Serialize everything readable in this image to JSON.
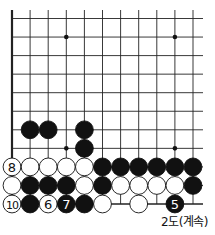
{
  "diagram": {
    "caption": "2도(계속)",
    "grid": {
      "cols": 11,
      "rows": 11,
      "x0": 12,
      "y0": 18.5,
      "dx": 18.1,
      "dy": 18.55,
      "top_extend": 10,
      "right_extend": 203,
      "left_edge": true,
      "bottom_edge": true
    },
    "star_points": [
      [
        3,
        1
      ],
      [
        9,
        1
      ],
      [
        3,
        7
      ],
      [
        9,
        7
      ]
    ],
    "colors": {
      "black": "#111111",
      "white": "#ffffff",
      "line": "#222222"
    },
    "stones": [
      {
        "col": 1,
        "row": 6,
        "color": "black"
      },
      {
        "col": 2,
        "row": 6,
        "color": "black"
      },
      {
        "col": 4,
        "row": 6,
        "color": "black"
      },
      {
        "col": 4,
        "row": 7,
        "color": "black"
      },
      {
        "col": 0,
        "row": 8,
        "color": "white",
        "label": "8"
      },
      {
        "col": 1,
        "row": 8,
        "color": "white"
      },
      {
        "col": 2,
        "row": 8,
        "color": "white"
      },
      {
        "col": 3,
        "row": 8,
        "color": "white"
      },
      {
        "col": 4,
        "row": 8,
        "color": "white"
      },
      {
        "col": 5,
        "row": 8,
        "color": "black"
      },
      {
        "col": 6,
        "row": 8,
        "color": "black"
      },
      {
        "col": 7,
        "row": 8,
        "color": "black"
      },
      {
        "col": 8,
        "row": 8,
        "color": "black"
      },
      {
        "col": 9,
        "row": 8,
        "color": "black"
      },
      {
        "col": 10,
        "row": 8,
        "color": "black"
      },
      {
        "col": 0,
        "row": 9,
        "color": "white"
      },
      {
        "col": 1,
        "row": 9,
        "color": "black"
      },
      {
        "col": 2,
        "row": 9,
        "color": "black"
      },
      {
        "col": 3,
        "row": 9,
        "color": "black"
      },
      {
        "col": 4,
        "row": 9,
        "color": "white"
      },
      {
        "col": 5,
        "row": 9,
        "color": "black"
      },
      {
        "col": 6,
        "row": 9,
        "color": "white"
      },
      {
        "col": 7,
        "row": 9,
        "color": "white"
      },
      {
        "col": 8,
        "row": 9,
        "color": "white"
      },
      {
        "col": 9,
        "row": 9,
        "color": "white"
      },
      {
        "col": 10,
        "row": 9,
        "color": "black"
      },
      {
        "col": 0,
        "row": 10,
        "color": "white",
        "label": "10"
      },
      {
        "col": 1,
        "row": 10,
        "color": "black"
      },
      {
        "col": 2,
        "row": 10,
        "color": "white",
        "label": "6"
      },
      {
        "col": 3,
        "row": 10,
        "color": "black",
        "label": "7"
      },
      {
        "col": 4,
        "row": 10,
        "color": "black"
      },
      {
        "col": 5,
        "row": 10,
        "color": "white"
      },
      {
        "col": 7,
        "row": 10,
        "color": "white"
      },
      {
        "col": 9,
        "row": 10,
        "color": "black",
        "label": "5"
      }
    ]
  }
}
